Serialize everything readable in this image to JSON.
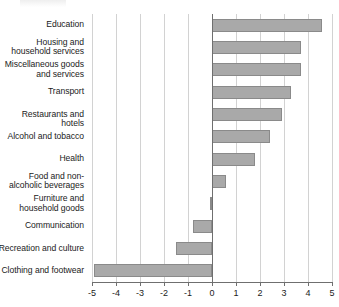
{
  "chart_data": {
    "type": "bar",
    "orientation": "horizontal",
    "title": "",
    "subtitle": "",
    "xlabel": "",
    "ylabel": "",
    "xlim": [
      -5,
      5
    ],
    "grid": true,
    "legend": null,
    "zero_line": 0,
    "categories": [
      "Education",
      "Housing and\nhousehold services",
      "Miscellaneous goods\nand services",
      "Transport",
      "Restaurants and hotels",
      "Alcohol and tobacco",
      "Health",
      "Food and non-\nalcoholic beverages",
      "Furniture and\nhousehold goods",
      "Communication",
      "Recreation and culture",
      "Clothing and footwear"
    ],
    "values": [
      4.6,
      3.7,
      3.7,
      3.3,
      2.9,
      2.4,
      1.8,
      0.6,
      -0.1,
      -0.8,
      -1.5,
      -4.9
    ],
    "xticks": [
      -5,
      -4,
      -3,
      -2,
      -1,
      0,
      1,
      2,
      3,
      4,
      5
    ],
    "xticklabels": [
      "-5",
      "-4",
      "-3",
      "-2",
      "-1",
      "0",
      "1",
      "2",
      "3",
      "4",
      "5"
    ],
    "bar_color": "#a9a9a9",
    "bar_border_color": "#8a8a8a",
    "grid_color": "#d2d2d2",
    "axis_color": "#6f6f6f"
  },
  "labels": {
    "categories": [
      {
        "lines": [
          "Education"
        ]
      },
      {
        "lines": [
          "Housing and",
          "household services"
        ]
      },
      {
        "lines": [
          "Miscellaneous goods",
          "and services"
        ]
      },
      {
        "lines": [
          "Transport"
        ]
      },
      {
        "lines": [
          "Restaurants and hotels"
        ]
      },
      {
        "lines": [
          "Alcohol and tobacco"
        ]
      },
      {
        "lines": [
          "Health"
        ]
      },
      {
        "lines": [
          "Food and non-",
          "alcoholic beverages"
        ]
      },
      {
        "lines": [
          "Furniture and",
          "household goods"
        ]
      },
      {
        "lines": [
          "Communication"
        ]
      },
      {
        "lines": [
          "Recreation and culture"
        ]
      },
      {
        "lines": [
          "Clothing and footwear"
        ]
      }
    ]
  }
}
